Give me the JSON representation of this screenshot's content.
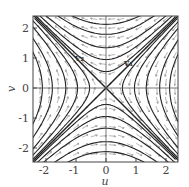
{
  "diagram": {
    "type": "phase_portrait",
    "xlabel": "u",
    "ylabel": "v",
    "x_ticks": [
      "-2",
      "-1",
      "0",
      "1",
      "2"
    ],
    "y_ticks": [
      "2",
      "1",
      "0",
      "-1",
      "-2"
    ],
    "x_range": [
      -2.43,
      2.4
    ],
    "y_range": [
      -2.47,
      2.4
    ],
    "eigenvector_labels": {
      "v1": "v₁",
      "v2": "v₂"
    },
    "colors": {
      "curve": "#222222",
      "arrow": "#777777",
      "axis": "#555555"
    }
  }
}
